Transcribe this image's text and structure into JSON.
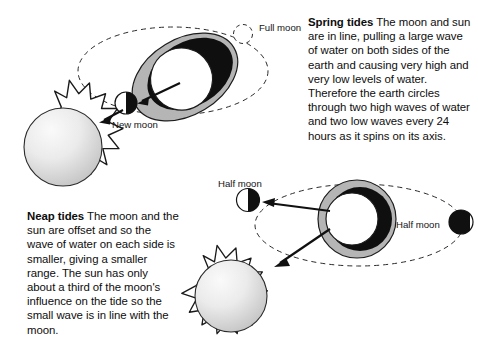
{
  "figure": {
    "background_color": "#ffffff",
    "ink_color": "#0d0d0d",
    "ring_gray": "#b3b3b3",
    "shadow_black": "#111111",
    "sun_fill_light": "#f2f2f2",
    "sun_fill_dark": "#b8b8b8"
  },
  "panels": {
    "spring": {
      "heading": "Spring tides",
      "body": " The moon and sun are in line, pulling a large wave of water on both sides of the earth and causing very high and very low levels of water. Therefore the earth circles through two high waves of water and two low waves every 24 hours as it spins on its axis."
    },
    "neap": {
      "heading": "Neap tides",
      "body": " The moon and the sun are offset and so the wave of water on each side is smaller, giving a smaller range. The sun has only about a third of the moon's influence on the tide so the small wave is in line with the moon."
    }
  },
  "labels": {
    "full_moon": "Full moon",
    "new_moon": "New moon",
    "half_moon_left": "Half moon",
    "half_moon_right": "Half moon"
  },
  "diagram_objects": {
    "spring": {
      "sun": "sun",
      "earth": "earth-with-elongated-tidal-bulge",
      "orbit": "dashed-lunar-orbit-ellipse",
      "new_moon_marker": "new-moon",
      "full_moon_marker": "full-moon-dashed-outline",
      "arrow": "arrow-from-earth-to-new-moon"
    },
    "neap": {
      "sun": "sun",
      "earth": "earth-with-circular-tidal-ring",
      "orbit": "dashed-lunar-orbit-ellipse",
      "half_moon_left_marker": "half-moon-left",
      "half_moon_right_marker": "half-moon-right",
      "arrows": "two-arrows-from-earth-to-sun-and-half-moon"
    }
  }
}
